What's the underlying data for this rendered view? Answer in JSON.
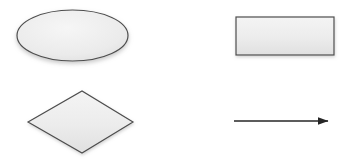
{
  "canvas": {
    "width": 356,
    "height": 163,
    "background_color": "#ffffff",
    "title": "Flowchart Shapes"
  },
  "style": {
    "shape_fill_top": "#f2f2f2",
    "shape_fill_bottom": "#e2e2e2",
    "shape_stroke": "#4d4d4d",
    "shape_stroke_width": 1.2,
    "connector_color": "#262626",
    "connector_width": 1.6,
    "shadow_color": "#bdbdbd"
  },
  "shapes": [
    {
      "id": "ellipse-shape",
      "name": "ellipse",
      "type": "ellipse",
      "label": "",
      "cx": 72.5,
      "cy": 35.5,
      "rx": 55.5,
      "ry": 25.5,
      "bbox": {
        "x": 17,
        "y": 10,
        "width": 111,
        "height": 51
      },
      "fill": "#ebebeb",
      "stroke": "#4d4d4d"
    },
    {
      "id": "rectangle-shape",
      "name": "rectangle",
      "type": "rectangle",
      "label": "",
      "bbox": {
        "x": 236,
        "y": 17,
        "width": 98,
        "height": 38
      },
      "fill": "#ebebeb",
      "stroke": "#4d4d4d"
    },
    {
      "id": "diamond-shape",
      "name": "diamond",
      "type": "diamond",
      "label": "",
      "points": "28,122 82,91 133,122 82,153",
      "bbox": {
        "x": 28,
        "y": 91,
        "width": 105,
        "height": 62
      },
      "fill": "#ebebeb",
      "stroke": "#4d4d4d"
    }
  ],
  "connectors": [
    {
      "id": "arrow-connector",
      "name": "arrow",
      "type": "arrow",
      "label": "",
      "x1": 234,
      "y1": 121,
      "x2": 328,
      "y2": 121,
      "head": "solid-triangle",
      "head_length": 11,
      "head_width": 8,
      "color": "#262626"
    }
  ]
}
